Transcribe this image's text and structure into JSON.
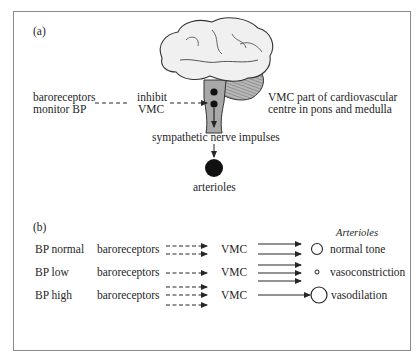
{
  "panel_a": {
    "label": "(a)",
    "baroreceptors_line1": "baroreceptors",
    "baroreceptors_line2": "monitor BP",
    "inhibit_line1": "inhibit",
    "inhibit_line2": "VMC",
    "vmc_note_line1": "VMC part of  cardiovascular",
    "vmc_note_line2": "centre in pons and medulla",
    "sympathetic": "sympathetic nerve impulses",
    "arterioles": "arterioles"
  },
  "panel_b": {
    "label": "(b)",
    "arterioles_header": "Arterioles",
    "rows": [
      {
        "condition": "BP normal",
        "source": "baroreceptors",
        "centre": "VMC",
        "afferent_arrows": 2,
        "efferent_arrows": 2,
        "vessel_size": "medium",
        "outcome": "normal tone"
      },
      {
        "condition": "BP low",
        "source": "baroreceptors",
        "centre": "VMC",
        "afferent_arrows": 1,
        "efferent_arrows": 3,
        "vessel_size": "small",
        "outcome": "vasoconstriction"
      },
      {
        "condition": "BP high",
        "source": "baroreceptors",
        "centre": "VMC",
        "afferent_arrows": 3,
        "efferent_arrows": 1,
        "vessel_size": "large",
        "outcome": "vasodilation"
      }
    ]
  },
  "colors": {
    "frame": "#8a8a8a",
    "ink": "#262626",
    "brainstem": "#a8a8a8",
    "cerebrum": "#f0f0f0"
  }
}
